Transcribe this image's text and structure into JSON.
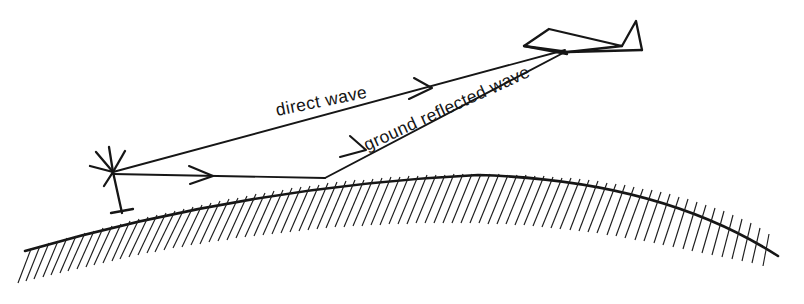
{
  "figure": {
    "background_color": "#ffffff",
    "ink_color": "#161616"
  },
  "labels": {
    "direct_wave": "direct wave",
    "ground_reflected_wave": "ground reflected wave"
  },
  "elements": {
    "antenna_name": "ground transmitting antenna",
    "aircraft_name": "aircraft receiver",
    "ground_name": "curved earth surface",
    "reflection_point_name": "ground reflection point"
  },
  "geometry": {
    "antenna_hub": [
      113,
      172
    ],
    "aircraft_nose": [
      565,
      50
    ],
    "reflection_point": [
      325,
      178
    ],
    "direct_arrow_tip": [
      430,
      88
    ],
    "incident_arrow_tip": [
      212,
      175
    ],
    "reflected_arrow_tip": [
      364,
      151
    ],
    "arc_left": [
      25,
      251
    ],
    "arc_apex": [
      478,
      175
    ],
    "arc_right": [
      778,
      256
    ]
  },
  "label_rotation": {
    "direct_wave_deg": -11.5,
    "ground_reflected_wave_deg": -24.5
  }
}
